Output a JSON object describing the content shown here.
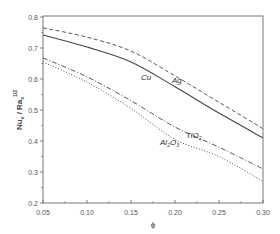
{
  "chart_data": {
    "type": "line",
    "title": "",
    "xlabel": "ϕ",
    "ylabel": "Nu_x / Ra_x^(1/2)",
    "xlim": [
      0.05,
      0.3
    ],
    "ylim": [
      0.2,
      0.8
    ],
    "x_ticks": [
      "0.05",
      "0.10",
      "0.15",
      "0.20",
      "0.25",
      "0.30"
    ],
    "y_ticks": [
      "0.2",
      "0.3",
      "0.4",
      "0.5",
      "0.6",
      "0.7",
      "0.8"
    ],
    "grid": false,
    "legend": "inline labels",
    "x": [
      0.05,
      0.1,
      0.15,
      0.2,
      0.25,
      0.3
    ],
    "series": [
      {
        "name": "Ag",
        "style": "dashed",
        "values": [
          0.765,
          0.735,
          0.69,
          0.61,
          0.525,
          0.44
        ]
      },
      {
        "name": "Cu",
        "style": "solid",
        "values": [
          0.742,
          0.703,
          0.655,
          0.575,
          0.49,
          0.41
        ]
      },
      {
        "name": "TiO2",
        "style": "dash-dot",
        "values": [
          0.668,
          0.607,
          0.53,
          0.445,
          0.38,
          0.31
        ]
      },
      {
        "name": "Al2O3",
        "style": "dotted",
        "values": [
          0.655,
          0.59,
          0.505,
          0.405,
          0.35,
          0.27
        ]
      }
    ],
    "annotations": [
      {
        "text": "Cu",
        "x": 0.18,
        "y": 0.61
      },
      {
        "text": "Ag",
        "x": 0.205,
        "y": 0.6
      },
      {
        "text": "TiO2",
        "x": 0.21,
        "y": 0.415
      },
      {
        "text": "Al2O3",
        "x": 0.18,
        "y": 0.39
      }
    ]
  },
  "labels": {
    "xlabel": "ϕ",
    "ylabel_main": "Nu",
    "ylabel_sub1": "x",
    "ylabel_mid": " / Ra",
    "ylabel_sub2": "x",
    "ylabel_sup": "1/2",
    "cu": "Cu",
    "ag": "Ag",
    "tio2_main": "TiO",
    "tio2_sub": "2",
    "al2o3_a": "Al",
    "al2o3_sub1": "2",
    "al2o3_b": "O",
    "al2o3_sub2": "3"
  }
}
